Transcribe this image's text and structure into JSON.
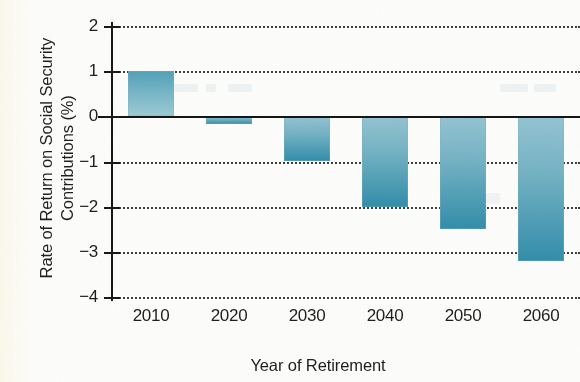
{
  "chart_data": {
    "type": "bar",
    "title": "",
    "xlabel": "Year of Retirement",
    "ylabel": "Rate of Return on Social Security Contributions (%)",
    "ylabel_lines": [
      "Rate of Return on Social Security",
      "Contributions (%)"
    ],
    "categories": [
      "2010",
      "2020",
      "2030",
      "2040",
      "2050",
      "2060"
    ],
    "values": [
      1.0,
      -0.18,
      -1.0,
      -2.0,
      -2.5,
      -3.2
    ],
    "ylim": [
      -4,
      2
    ],
    "yticks": [
      2,
      1,
      0,
      -1,
      -2,
      -3,
      -4
    ],
    "ytick_labels": [
      "2",
      "1",
      "0",
      "−1",
      "−2",
      "−3",
      "−4"
    ],
    "grid": "horizontal-dotted",
    "gridlines_at": [
      2,
      1,
      -1,
      -2,
      -3,
      -4
    ],
    "zero_line": true,
    "legend": "none",
    "bar_color_top": "#93c3d1",
    "bar_color_bottom": "#2f8ca9",
    "axis_color": "#141414",
    "background": "#fdfdfb"
  }
}
